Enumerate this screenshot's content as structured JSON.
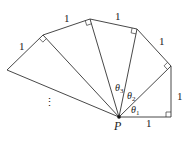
{
  "diagram": {
    "type": "spiral-of-theodorus",
    "center_label": "P",
    "center": [
      119,
      117
    ],
    "outer_vertices": [
      [
        171,
        117
      ],
      [
        171,
        66
      ],
      [
        137,
        29
      ],
      [
        90,
        19
      ],
      [
        43,
        35
      ],
      [
        7,
        70
      ]
    ],
    "side_labels": [
      {
        "text": "1",
        "x": 146,
        "y": 127
      },
      {
        "text": "1",
        "x": 177,
        "y": 100
      },
      {
        "text": "1",
        "x": 159,
        "y": 45
      },
      {
        "text": "1",
        "x": 115,
        "y": 20
      },
      {
        "text": "1",
        "x": 64,
        "y": 22
      },
      {
        "text": "1",
        "x": 19,
        "y": 50
      }
    ],
    "angles": [
      {
        "symbol": "θ",
        "sub": "1",
        "x": 131,
        "y": 113
      },
      {
        "symbol": "θ",
        "sub": "2",
        "x": 127,
        "y": 99
      },
      {
        "symbol": "θ",
        "sub": "3",
        "x": 115,
        "y": 91
      }
    ],
    "continuation": "⋮",
    "stroke_color": "#333333"
  }
}
